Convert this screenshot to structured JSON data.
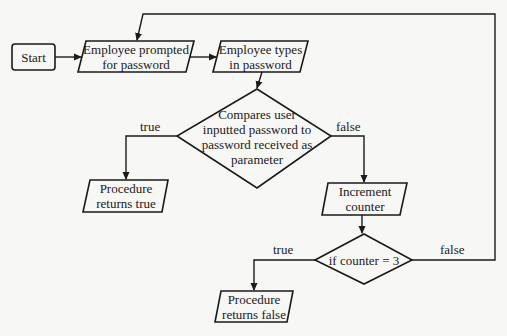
{
  "diagram": {
    "type": "flowchart",
    "colors": {
      "background": "#f7f7f5",
      "stroke": "#1a1a1a",
      "text": "#1a1a1a"
    },
    "nodes": {
      "start": {
        "shape": "rounded-rect",
        "text": "Start"
      },
      "prompted": {
        "shape": "parallelogram",
        "text": "Employee prompted\nfor password"
      },
      "types": {
        "shape": "parallelogram",
        "text": "Employee types\nin password"
      },
      "compare": {
        "shape": "diamond",
        "text": "Compares user\ninputted password to\npassword received as\nparameter"
      },
      "returns_true": {
        "shape": "parallelogram",
        "text": "Procedure\nreturns true"
      },
      "increment": {
        "shape": "parallelogram",
        "text": "Increment\ncounter"
      },
      "check_counter": {
        "shape": "diamond",
        "text": "if counter = 3"
      },
      "returns_false": {
        "shape": "parallelogram",
        "text": "Procedure\nreturns false"
      }
    },
    "edges": {
      "compare_true": {
        "from": "compare",
        "to": "returns_true",
        "label": "true"
      },
      "compare_false": {
        "from": "compare",
        "to": "increment",
        "label": "false"
      },
      "counter_true": {
        "from": "check_counter",
        "to": "returns_false",
        "label": "true"
      },
      "counter_false": {
        "from": "check_counter",
        "to": "prompted",
        "label": "false"
      },
      "start_to_prompted": {
        "from": "start",
        "to": "prompted",
        "label": ""
      },
      "prompted_to_types": {
        "from": "prompted",
        "to": "types",
        "label": ""
      },
      "types_to_compare": {
        "from": "types",
        "to": "compare",
        "label": ""
      },
      "increment_to_counter": {
        "from": "increment",
        "to": "check_counter",
        "label": ""
      }
    }
  }
}
